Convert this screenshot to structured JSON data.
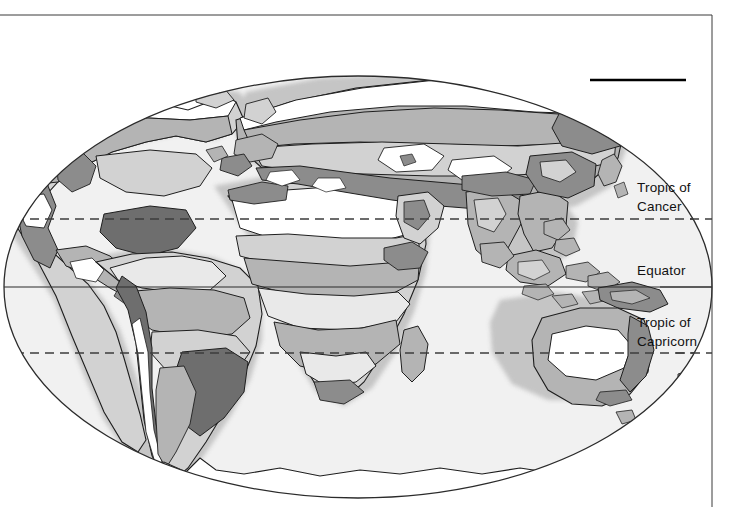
{
  "document": {
    "type": "world-map-figure",
    "projection": "elliptical (Mollweide-like) world map",
    "theme": "world climate / vegetation zones, greyscale shading"
  },
  "page_frame": {
    "top_rule": {
      "name": "top-border-rule",
      "y": 15,
      "x1": 0,
      "x2": 712,
      "color": "#3a3a3a",
      "width_px": 1
    },
    "right_rule": {
      "name": "right-border-rule",
      "x": 712,
      "y1": 15,
      "y2": 507,
      "color": "#3a3a3a",
      "width_px": 1
    },
    "marker_rule": {
      "name": "top-right-marker-rule",
      "y": 80,
      "x1": 590,
      "x2": 686,
      "color": "#000000",
      "width_px": 2.6
    }
  },
  "map": {
    "ellipse": {
      "cx": 358,
      "cy": 287,
      "rx": 354,
      "ry": 211,
      "fill": "#f1f1f1",
      "stroke": "#2b2b2b"
    },
    "outside_fill": "#ffffff"
  },
  "latitude_lines": [
    {
      "id": "tropic-of-cancer",
      "label": "Tropic of\nCancer",
      "label_line1": "Tropic of",
      "label_line2": "Cancer",
      "y": 219,
      "style": "dashed",
      "color": "#3d3d3d"
    },
    {
      "id": "equator",
      "label": "Equator",
      "label_line1": "Equator",
      "label_line2": "",
      "y": 287,
      "style": "solid",
      "color": "#2b2b2b"
    },
    {
      "id": "tropic-of-capricorn",
      "label": "Tropic of\nCapricorn",
      "label_line1": "Tropic of",
      "label_line2": "Capricorn",
      "y": 353,
      "style": "dashed",
      "color": "#3d3d3d"
    }
  ],
  "labels": {
    "tropic_of_cancer_line1": "Tropic of",
    "tropic_of_cancer_line2": "Cancer",
    "equator": "Equator",
    "tropic_of_capricorn_line1": "Tropic of",
    "tropic_of_capricorn_line2": "Capricorn"
  },
  "shading_legend": {
    "description": "Greyscale zone fills used across the landmasses",
    "tones": [
      {
        "name": "zone-white",
        "hex": "#ffffff"
      },
      {
        "name": "zone-very-light",
        "hex": "#e9e9e9"
      },
      {
        "name": "zone-light-grey",
        "hex": "#d2d2d2"
      },
      {
        "name": "zone-mid-grey",
        "hex": "#b4b4b4"
      },
      {
        "name": "zone-dark-grey",
        "hex": "#8c8c8c"
      },
      {
        "name": "zone-darkest",
        "hex": "#6e6e6e"
      },
      {
        "name": "coast-halo",
        "hex": "#bdbdbd"
      },
      {
        "name": "outline",
        "hex": "#1e1e1e"
      }
    ]
  },
  "landmasses": [
    {
      "name": "north-america"
    },
    {
      "name": "greenland"
    },
    {
      "name": "south-america"
    },
    {
      "name": "africa"
    },
    {
      "name": "europe"
    },
    {
      "name": "asia"
    },
    {
      "name": "southeast-asia-islands"
    },
    {
      "name": "australia"
    },
    {
      "name": "new-zealand"
    },
    {
      "name": "antarctica"
    },
    {
      "name": "madagascar"
    },
    {
      "name": "japan"
    },
    {
      "name": "british-isles"
    }
  ]
}
